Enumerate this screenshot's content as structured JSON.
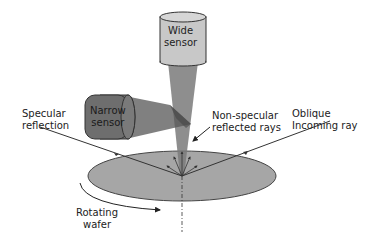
{
  "labels": {
    "wide_sensor": [
      "Wide",
      "sensor"
    ],
    "narrow_sensor": [
      "Narrow",
      "sensor"
    ],
    "specular_reflection": [
      "Specular",
      "reflection"
    ],
    "non_specular": [
      "Non-specular",
      "reflected rays"
    ],
    "oblique": [
      "Oblique",
      "Incoming ray"
    ],
    "rotating_wafer": [
      "Rotating",
      "wafer"
    ]
  },
  "colors": {
    "sensor_fill": "#c8c8c8",
    "narrow_sensor_fill": "#6e6e6e",
    "beam": "#7a7a7a",
    "wafer_fill": "#a6a6a6",
    "line": "#333333"
  }
}
